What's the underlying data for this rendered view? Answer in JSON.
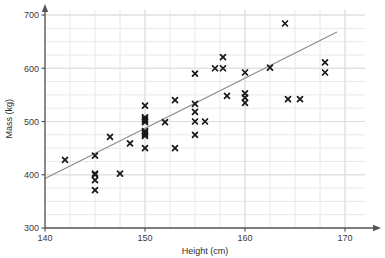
{
  "chart_data": {
    "type": "scatter",
    "title": "",
    "xlabel": "Height (cm)",
    "ylabel": "Mass (kg)",
    "xlim": [
      140,
      172
    ],
    "ylim": [
      300,
      710
    ],
    "xticks": [
      140,
      150,
      160,
      170
    ],
    "yticks": [
      300,
      400,
      500,
      600,
      700
    ],
    "xtick_labels": [
      "140",
      "150",
      "160",
      "170"
    ],
    "ytick_labels": [
      "300",
      "400",
      "500",
      "600",
      "700"
    ],
    "x_minor_step": 2.5,
    "y_minor_step": 25,
    "grid": true,
    "grid_color": "#e8e8e8",
    "legend": null,
    "marker": "x",
    "marker_color": "#1a1a1a",
    "marker_size": 5,
    "axis_color": "#555555",
    "points": [
      {
        "x": 142.0,
        "y": 428
      },
      {
        "x": 145.0,
        "y": 436
      },
      {
        "x": 145.0,
        "y": 402
      },
      {
        "x": 145.0,
        "y": 400
      },
      {
        "x": 145.0,
        "y": 390
      },
      {
        "x": 145.0,
        "y": 371
      },
      {
        "x": 146.5,
        "y": 471
      },
      {
        "x": 147.5,
        "y": 402
      },
      {
        "x": 148.5,
        "y": 459
      },
      {
        "x": 150.0,
        "y": 530
      },
      {
        "x": 150.0,
        "y": 508
      },
      {
        "x": 150.0,
        "y": 505
      },
      {
        "x": 150.0,
        "y": 502
      },
      {
        "x": 150.0,
        "y": 499
      },
      {
        "x": 150.0,
        "y": 482
      },
      {
        "x": 150.0,
        "y": 479
      },
      {
        "x": 150.0,
        "y": 476
      },
      {
        "x": 150.0,
        "y": 473
      },
      {
        "x": 150.0,
        "y": 450
      },
      {
        "x": 152.0,
        "y": 499
      },
      {
        "x": 153.0,
        "y": 540
      },
      {
        "x": 153.0,
        "y": 450
      },
      {
        "x": 155.0,
        "y": 590
      },
      {
        "x": 155.0,
        "y": 533
      },
      {
        "x": 155.0,
        "y": 518
      },
      {
        "x": 155.0,
        "y": 500
      },
      {
        "x": 155.0,
        "y": 475
      },
      {
        "x": 156.0,
        "y": 500
      },
      {
        "x": 157.0,
        "y": 600
      },
      {
        "x": 157.8,
        "y": 621
      },
      {
        "x": 157.8,
        "y": 600
      },
      {
        "x": 158.2,
        "y": 548
      },
      {
        "x": 160.0,
        "y": 592
      },
      {
        "x": 160.0,
        "y": 553
      },
      {
        "x": 160.0,
        "y": 545
      },
      {
        "x": 160.0,
        "y": 535
      },
      {
        "x": 162.5,
        "y": 601
      },
      {
        "x": 164.0,
        "y": 684
      },
      {
        "x": 164.3,
        "y": 542
      },
      {
        "x": 165.5,
        "y": 542
      },
      {
        "x": 168.0,
        "y": 611
      },
      {
        "x": 168.0,
        "y": 592
      }
    ],
    "trendline": {
      "label": "line of best fit",
      "color": "#8a8a8a",
      "x_start": 140.0,
      "y_start": 393,
      "x_end": 169.2,
      "y_end": 668
    }
  }
}
